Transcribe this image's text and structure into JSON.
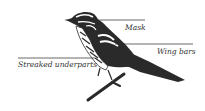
{
  "diagram": {
    "colors": {
      "ink": "#2a2a2a",
      "background": "#ffffff"
    },
    "labels": [
      {
        "id": "mask",
        "text": "Mask"
      },
      {
        "id": "wing-bars",
        "text": "Wing bars"
      },
      {
        "id": "streaked-underparts",
        "text": "Streaked underparts"
      }
    ]
  }
}
